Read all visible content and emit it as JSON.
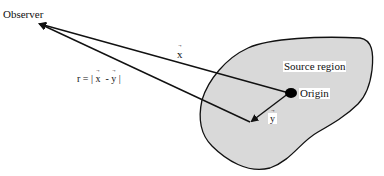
{
  "diagram": {
    "labels": {
      "observer": "Observer",
      "x_vector": "x",
      "r_equation_prefix": "r = |",
      "r_equation_x": "x",
      "r_equation_minus": "-",
      "r_equation_y": "y",
      "r_equation_suffix": "|",
      "source_region": "Source region",
      "origin": "Origin",
      "y_vector": "y"
    },
    "colors": {
      "line": "#111111",
      "region_fill": "#d9d9d9",
      "background": "#ffffff"
    }
  }
}
